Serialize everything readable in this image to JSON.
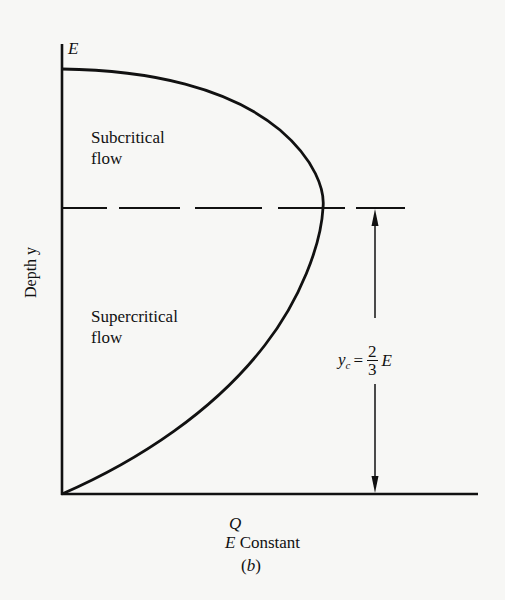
{
  "figure": {
    "caption": "(b)",
    "x_axis": {
      "label": "Q",
      "sublabel_var": "E",
      "sublabel_text": "Constant"
    },
    "y_axis": {
      "label": "Depth y",
      "top_label": "E"
    },
    "regions": [
      {
        "name": "subcritical",
        "line1": "Subcritical",
        "line2": "flow"
      },
      {
        "name": "supercritical",
        "line1": "Supercritical",
        "line2": "flow"
      }
    ],
    "critical_depth": {
      "lhs": "y",
      "lhs_sub": "c",
      "equals": "=",
      "numerator": "2",
      "denominator": "3",
      "rhs": "E"
    },
    "colors": {
      "ink": "#111111",
      "paper": "#f7f7f5"
    }
  },
  "chart_data": {
    "type": "line",
    "title": "",
    "xlabel": "Q (E Constant)",
    "ylabel": "Depth y",
    "curve_description": "Discharge Q vs depth y at constant specific energy E; Q=0 at y=0 and y=E, maximum Q at critical depth y_c = 2/3 E",
    "series": [
      {
        "name": "Q-y curve",
        "points_normalized": [
          {
            "y": 0.0,
            "Q": 0.0
          },
          {
            "y": 0.1,
            "Q": 0.33
          },
          {
            "y": 0.2,
            "Q": 0.53
          },
          {
            "y": 0.3,
            "Q": 0.7
          },
          {
            "y": 0.4,
            "Q": 0.83
          },
          {
            "y": 0.5,
            "Q": 0.92
          },
          {
            "y": 0.6,
            "Q": 0.99
          },
          {
            "y": 0.667,
            "Q": 1.0
          },
          {
            "y": 0.75,
            "Q": 0.97
          },
          {
            "y": 0.85,
            "Q": 0.8
          },
          {
            "y": 0.95,
            "Q": 0.45
          },
          {
            "y": 1.0,
            "Q": 0.0
          }
        ]
      }
    ],
    "annotations": [
      "E (top of y-axis)",
      "Subcritical flow (above y_c)",
      "Supercritical flow (below y_c)",
      "y_c = 2/3 E (dashed line with dimension arrow)"
    ],
    "grid": false,
    "legend": "none"
  }
}
